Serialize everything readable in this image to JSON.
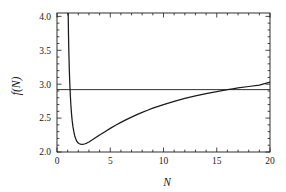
{
  "chart_data": {
    "type": "line",
    "title": "",
    "xlabel": "N",
    "ylabel": "f(N)",
    "xlim": [
      0,
      20
    ],
    "ylim": [
      2.0,
      4.05
    ],
    "grid": false,
    "legend": null,
    "x_ticks": [
      0,
      5,
      10,
      15,
      20
    ],
    "x_tick_labels": [
      "0",
      "5",
      "10",
      "15",
      "20"
    ],
    "x_minor_tick_step": 1,
    "y_ticks": [
      2.0,
      2.5,
      3.0,
      3.5,
      4.0
    ],
    "y_tick_labels": [
      "2.0",
      "2.5",
      "3.0",
      "3.5",
      "4.0"
    ],
    "y_minor_tick_step": 0.1,
    "line_color": "#1a1a1a",
    "series": [
      {
        "name": "f(N)",
        "type": "curve",
        "x": [
          1.02,
          1.05,
          1.08,
          1.12,
          1.16,
          1.2,
          1.25,
          1.3,
          1.36,
          1.42,
          1.5,
          1.58,
          1.66,
          1.75,
          1.85,
          1.95,
          2.05,
          2.2,
          2.35,
          2.5,
          2.65,
          2.8,
          3.0,
          3.25,
          3.5,
          3.75,
          4.0,
          4.5,
          5.0,
          5.5,
          6.0,
          6.5,
          7.0,
          7.5,
          8.0,
          8.5,
          9.0,
          9.5,
          10.0,
          11.0,
          12.0,
          13.0,
          14.0,
          15.0,
          16.0,
          16.5,
          17.0,
          18.0,
          19.0,
          20.0
        ],
        "y": [
          4.6,
          4.05,
          3.72,
          3.42,
          3.2,
          3.02,
          2.84,
          2.7,
          2.57,
          2.47,
          2.37,
          2.3,
          2.24,
          2.2,
          2.16,
          2.14,
          2.125,
          2.115,
          2.112,
          2.115,
          2.122,
          2.132,
          2.148,
          2.172,
          2.198,
          2.224,
          2.25,
          2.3,
          2.348,
          2.394,
          2.437,
          2.477,
          2.515,
          2.551,
          2.584,
          2.616,
          2.646,
          2.674,
          2.7,
          2.748,
          2.79,
          2.828,
          2.862,
          2.892,
          2.92,
          2.932,
          2.944,
          2.966,
          2.986,
          3.03
        ]
      },
      {
        "name": "reference",
        "type": "horizontal-line",
        "y_value": 2.92,
        "x": [
          0,
          20
        ],
        "y": [
          2.92,
          2.92
        ]
      }
    ],
    "annotations": [
      {
        "description": "vertical asymptote near N = 1"
      },
      {
        "description": "curve minimum f(N) ~ 2.11 near N = 2.4"
      },
      {
        "description": "curve crosses horizontal reference line near N = 16.5"
      }
    ]
  },
  "axes": {
    "y_title": "f(N)",
    "x_title": "N",
    "y_labels": [
      "4.0",
      "3.5",
      "3.0",
      "2.5",
      "2.0"
    ],
    "x_labels": [
      "0",
      "5",
      "10",
      "15",
      "20"
    ]
  }
}
